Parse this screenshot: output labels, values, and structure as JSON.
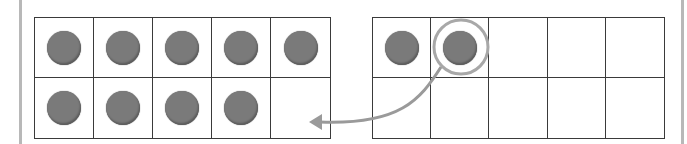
{
  "figure": {
    "colors": {
      "grid_line": "#3a3a3a",
      "counter": "#7a7a7a",
      "highlight": "#a8a8a8",
      "side_bar": "#b8b8b8"
    },
    "left_frame": {
      "counters": 9,
      "cells": [
        true,
        true,
        true,
        true,
        true,
        true,
        true,
        true,
        true,
        false
      ]
    },
    "right_frame": {
      "counters": 2,
      "cells": [
        true,
        true,
        false,
        false,
        false,
        false,
        false,
        false,
        false,
        false
      ],
      "highlighted_cell": 1
    },
    "arrow": {
      "from": "right_frame.cell_2",
      "to": "left_frame.cell_10",
      "icon": "curved-arrow-icon"
    }
  }
}
